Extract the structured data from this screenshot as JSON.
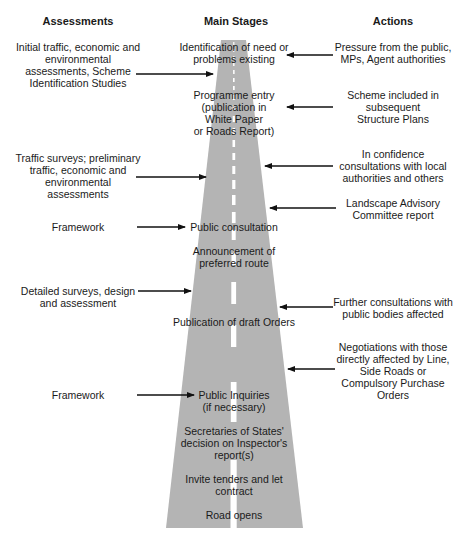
{
  "colors": {
    "road": "#b4b4b4",
    "lane": "#ffffff",
    "arrow": "#111111",
    "text": "#1a1a1a"
  },
  "headers": {
    "assessments": "Assessments",
    "main_stages": "Main Stages",
    "actions": "Actions"
  },
  "assessments": [
    {
      "text": "Initial traffic, economic and\nenvironmental\nassessments, Scheme\nIdentification Studies"
    },
    {
      "text": "Traffic surveys; preliminary\ntraffic, economic and\nenvironmental\nassessments"
    },
    {
      "text": "Framework"
    },
    {
      "text": "Detailed surveys, design\nand assessment"
    },
    {
      "text": "Framework"
    }
  ],
  "main_stages": [
    {
      "text": "Identification of need or\nproblems existing"
    },
    {
      "text": "Programme entry\n(publication in\nWhite Paper\nor Roads Report)"
    },
    {
      "text": "Public consultation"
    },
    {
      "text": "Announcement of\npreferred route"
    },
    {
      "text": "Publication of draft Orders"
    },
    {
      "text": "Public Inquiries\n(if necessary)"
    },
    {
      "text": "Secretaries of States'\ndecision on Inspector's\nreport(s)"
    },
    {
      "text": "Invite tenders and let\ncontract"
    },
    {
      "text": "Road opens"
    }
  ],
  "actions": [
    {
      "text": "Pressure from the public,\nMPs, Agent authorities"
    },
    {
      "text": "Scheme included in\nsubsequent\nStructure Plans"
    },
    {
      "text": "In confidence\nconsultations with local\nauthorities and others"
    },
    {
      "text": "Landscape Advisory\nCommittee report"
    },
    {
      "text": "Further consultations with\npublic bodies affected"
    },
    {
      "text": "Negotiations with those\ndirectly affected by Line,\nSide Roads or\nCompulsory Purchase\nOrders"
    }
  ]
}
